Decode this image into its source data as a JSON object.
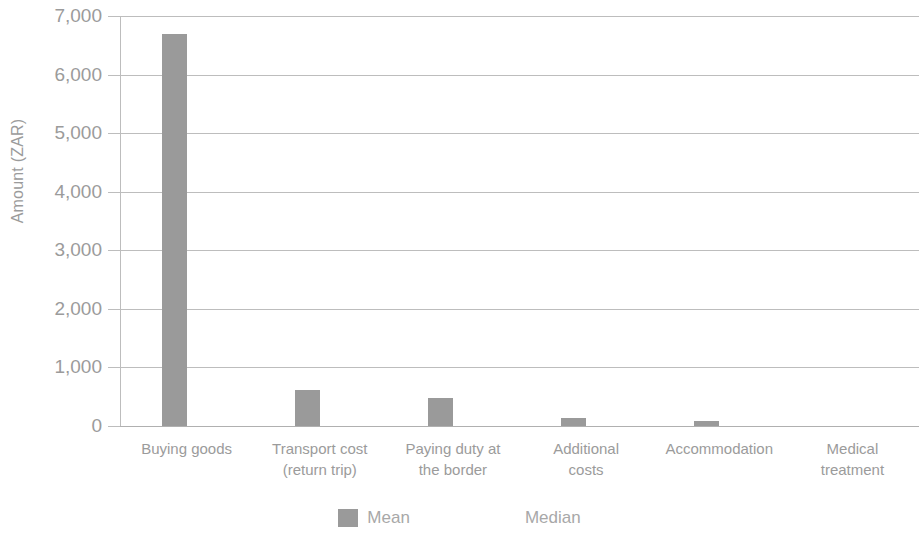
{
  "chart_data": {
    "type": "bar",
    "title": "",
    "subtitle": "",
    "xlabel": "",
    "ylabel": "Amount (ZAR)",
    "ylim": [
      0,
      7000
    ],
    "ytick_step": 1000,
    "ytick_labels": [
      "7,000",
      "6,000",
      "5,000",
      "4,000",
      "3,000",
      "2,000",
      "1,000",
      "0"
    ],
    "ytick_values": [
      7000,
      6000,
      5000,
      4000,
      3000,
      2000,
      1000,
      0
    ],
    "grid": true,
    "legend_position": "bottom",
    "categories": [
      "Buying goods",
      "Transport cost\n(return trip)",
      "Paying duty at\nthe border",
      "Additional\ncosts",
      "Accommodation",
      "Medical\ntreatment"
    ],
    "series": [
      {
        "name": "Mean",
        "color": "#9a9a9a",
        "values": [
          6700,
          610,
          480,
          130,
          80,
          0
        ]
      },
      {
        "name": "Median",
        "color": "#ffffff",
        "values": [
          0,
          0,
          0,
          0,
          0,
          0
        ]
      }
    ]
  },
  "legend": {
    "items": [
      {
        "label": "Mean",
        "swatch": "mean-swatch"
      },
      {
        "label": "Median",
        "swatch": "median-swatch"
      }
    ]
  }
}
